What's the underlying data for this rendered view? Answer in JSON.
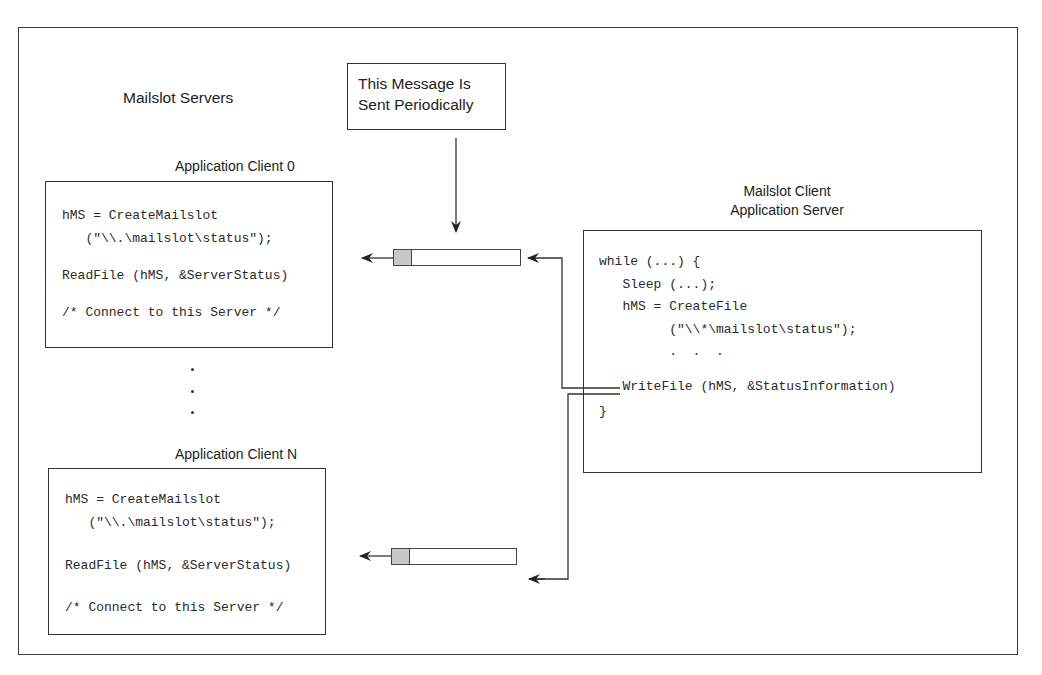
{
  "title_left": "Mailslot Servers",
  "message_box": {
    "line1": "This Message Is",
    "line2": "Sent Periodically"
  },
  "client0": {
    "title": "Application Client 0",
    "code": [
      "hMS = CreateMailslot",
      "   (\"\\\\.\\mailslot\\status\");",
      "",
      "ReadFile (hMS, &ServerStatus)",
      "",
      "/* Connect to this Server */"
    ]
  },
  "clientN": {
    "title": "Application Client N",
    "code": [
      "hMS = CreateMailslot",
      "   (\"\\\\.\\mailslot\\status\");",
      "",
      "ReadFile (hMS, &ServerStatus)",
      "",
      "/* Connect to this Server */"
    ]
  },
  "server": {
    "title_line1": "Mailslot Client",
    "title_line2": "Application Server",
    "code": [
      "while (...) {",
      "   Sleep (...);",
      "   hMS = CreateFile",
      "         (\"\\\\*\\mailslot\\status\");",
      "         .  .  .",
      "   WriteFile (hMS, &StatusInformation)",
      "}"
    ]
  },
  "ellipsis_dots": 3,
  "colors": {
    "line": "#333333",
    "queue_head": "#c8c8c8",
    "background": "#ffffff"
  }
}
